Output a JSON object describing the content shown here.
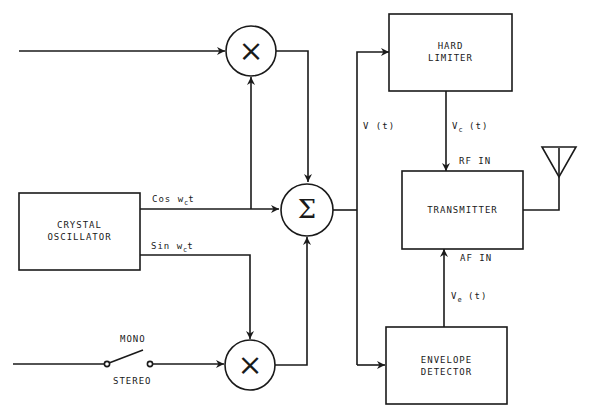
{
  "diagram": {
    "type": "block-diagram",
    "blocks": {
      "crystal_oscillator": {
        "line1": "CRYSTAL",
        "line2": "OSCILLATOR"
      },
      "hard_limiter": {
        "line1": "HARD",
        "line2": "LIMITER"
      },
      "transmitter": {
        "label": "TRANSMITTER"
      },
      "envelope_detector": {
        "line1": "ENVELOPE",
        "line2": "DETECTOR"
      }
    },
    "operators": {
      "top_multiplier": "×",
      "summer": "Σ",
      "bottom_multiplier": "×"
    },
    "signals": {
      "cos": {
        "prefix": "Cos w",
        "sub": "c",
        "suffix": "t"
      },
      "sin": {
        "prefix": "Sin w",
        "sub": "c",
        "suffix": "t"
      },
      "v_t": "V (t)",
      "vc": {
        "prefix": "V",
        "sub": "c",
        "suffix": " (t)"
      },
      "ve": {
        "prefix": "V",
        "sub": "e",
        "suffix": " (t)"
      },
      "rf_in": "RF IN",
      "af_in": "AF IN"
    },
    "switch": {
      "mono": "MONO",
      "stereo": "STEREO"
    },
    "colors": {
      "line": "#1a1a1a",
      "background": "#ffffff"
    }
  }
}
